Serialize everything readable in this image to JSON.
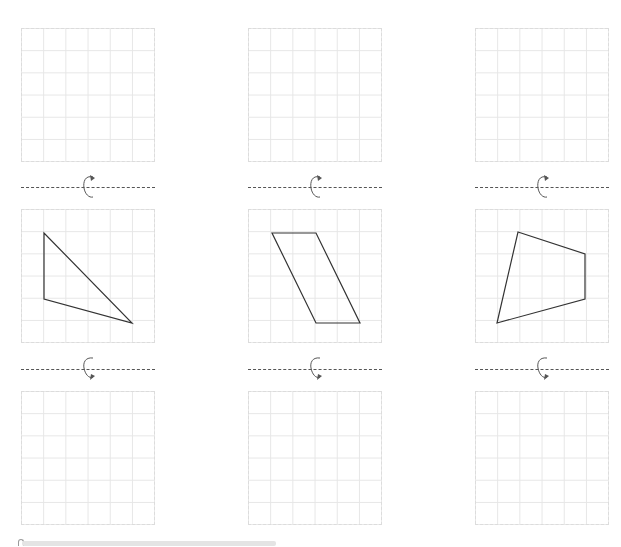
{
  "worksheet": {
    "grid": {
      "cols": 6,
      "rows": 6,
      "cell_px": 22.2
    },
    "colors": {
      "grid_line": "#e6e6e6",
      "shape_stroke": "#333333",
      "axis_line": "#555555",
      "icon": "#555555"
    },
    "columns": [
      {
        "id": "triangle",
        "shape_name": "triangle",
        "vertices_grid": [
          [
            1,
            1
          ],
          [
            1,
            4
          ],
          [
            5,
            5
          ]
        ],
        "top_rotation_icon": "rotate-clockwise-up-arrow",
        "bottom_rotation_icon": "rotate-clockwise-down-arrow"
      },
      {
        "id": "parallelogram",
        "shape_name": "parallelogram",
        "vertices_grid": [
          [
            1,
            1
          ],
          [
            3,
            1
          ],
          [
            5,
            5
          ],
          [
            3,
            5
          ]
        ],
        "top_rotation_icon": "rotate-clockwise-up-arrow",
        "bottom_rotation_icon": "rotate-clockwise-down-arrow"
      },
      {
        "id": "quadrilateral",
        "shape_name": "quadrilateral",
        "vertices_grid": [
          [
            2,
            1
          ],
          [
            5,
            2
          ],
          [
            5,
            4
          ],
          [
            1,
            5
          ]
        ],
        "top_rotation_icon": "rotate-clockwise-up-arrow",
        "bottom_rotation_icon": "rotate-clockwise-down-arrow"
      }
    ]
  },
  "scrollbar": {
    "orientation": "horizontal"
  }
}
